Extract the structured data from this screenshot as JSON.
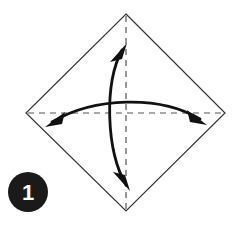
{
  "figure": {
    "canvas": {
      "width": 238,
      "height": 226,
      "background": "#ffffff"
    },
    "step_badge": {
      "label": "1",
      "shape": "filled-circle",
      "cx": 28,
      "cy": 192,
      "r": 20,
      "fill": "#1a1a1a",
      "text_color": "#ffffff"
    },
    "paper": {
      "name": "square-sheet-rotated-45",
      "stroke": "#333333",
      "stroke_width": 1.2,
      "fill": "#ffffff",
      "vertices": [
        {
          "name": "top",
          "x": 126,
          "y": 14
        },
        {
          "name": "right",
          "x": 225,
          "y": 113
        },
        {
          "name": "bottom",
          "x": 126,
          "y": 211
        },
        {
          "name": "left",
          "x": 26,
          "y": 113
        }
      ]
    },
    "crease_lines": [
      {
        "name": "vertical-crease",
        "orientation": "vertical",
        "x1": 126,
        "y1": 16,
        "x2": 126,
        "y2": 209,
        "style": "dashed",
        "dash": "6 5",
        "stroke": "#555555",
        "stroke_width": 1.2
      },
      {
        "name": "horizontal-crease",
        "orientation": "horizontal",
        "x1": 28,
        "y1": 113,
        "x2": 223,
        "y2": 113,
        "style": "dashed",
        "dash": "6 5",
        "stroke": "#555555",
        "stroke_width": 1.2
      }
    ],
    "arrows": [
      {
        "name": "vertical-fold-arrow",
        "direction": "double-headed",
        "orientation": "vertical",
        "bow": "left",
        "stroke": "#111111",
        "stroke_width": 2.6,
        "path": "M 128 188 C 106 150, 104 84, 124 47",
        "head_start": {
          "x": 128,
          "y": 190,
          "angle_deg": 62
        },
        "head_end": {
          "x": 126,
          "y": 44,
          "angle_deg": -62
        }
      },
      {
        "name": "horizontal-fold-arrow",
        "direction": "double-headed",
        "orientation": "horizontal",
        "bow": "up",
        "stroke": "#111111",
        "stroke_width": 2.6,
        "path": "M 49 124 C 92 97, 160 95, 203 121",
        "head_start": {
          "x": 46,
          "y": 126,
          "angle_deg": 212
        },
        "head_end": {
          "x": 206,
          "y": 124,
          "angle_deg": 32
        }
      }
    ]
  }
}
